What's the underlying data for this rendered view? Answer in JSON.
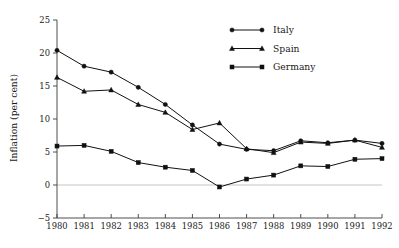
{
  "chart_data": {
    "type": "line",
    "title": "",
    "xlabel": "",
    "ylabel": "Inflation (per cent)",
    "ylim": [
      -5,
      25
    ],
    "yticks": [
      -5,
      0,
      5,
      10,
      15,
      20,
      25
    ],
    "ytick_labels": [
      "−5",
      "0",
      "5",
      "10",
      "15",
      "20",
      "25"
    ],
    "x": [
      1980,
      1981,
      1982,
      1983,
      1984,
      1985,
      1986,
      1987,
      1988,
      1989,
      1990,
      1991,
      1992
    ],
    "categories": [
      "1980",
      "1981",
      "1982",
      "1983",
      "1984",
      "1985",
      "1986",
      "1987",
      "1988",
      "1989",
      "1990",
      "1991",
      "1992"
    ],
    "xlim": [
      1980,
      1992
    ],
    "grid": false,
    "zero_line": true,
    "legend_position": "top-right",
    "series": [
      {
        "name": "Italy",
        "marker": "circle",
        "color": "#111111",
        "values": [
          20.4,
          18.0,
          17.1,
          14.8,
          12.2,
          9.1,
          6.2,
          5.4,
          5.2,
          6.7,
          6.4,
          6.8,
          6.3
        ]
      },
      {
        "name": "Spain",
        "marker": "triangle",
        "color": "#111111",
        "values": [
          16.3,
          14.2,
          14.4,
          12.2,
          11.0,
          8.4,
          9.4,
          5.5,
          4.9,
          6.5,
          6.3,
          6.8,
          5.7
        ]
      },
      {
        "name": "Germany",
        "marker": "square",
        "color": "#111111",
        "values": [
          5.9,
          6.0,
          5.1,
          3.4,
          2.7,
          2.2,
          -0.3,
          0.9,
          1.5,
          2.9,
          2.8,
          3.9,
          4.0
        ]
      }
    ]
  },
  "legend": {
    "items": [
      {
        "label": "Italy",
        "marker": "circle"
      },
      {
        "label": "Spain",
        "marker": "triangle"
      },
      {
        "label": "Germany",
        "marker": "square"
      }
    ]
  },
  "axes": {
    "y_title": "Inflation (per cent)"
  }
}
